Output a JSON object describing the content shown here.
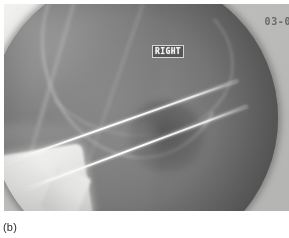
{
  "figure": {
    "caption": "(b)",
    "modality": "fluoroscopic radiograph"
  },
  "radiograph": {
    "overlays": {
      "laterality": "RIGHT",
      "timestamp": "03-0"
    },
    "field": {
      "shape": "circle",
      "description": "image-intensifier circular field"
    },
    "features": [
      {
        "name": "fixation-pin-upper",
        "kind": "metal pin",
        "orientation": "oblique, lower-left to upper-right"
      },
      {
        "name": "fixation-pin-lower",
        "kind": "metal pin",
        "orientation": "oblique, lower-left to upper-right, parallel to upper pin"
      },
      {
        "name": "radio-opaque-block",
        "kind": "bright opaque object",
        "location": "lower left"
      },
      {
        "name": "bone-mass-proximal",
        "kind": "bone",
        "location": "upper left"
      },
      {
        "name": "lucency-region",
        "kind": "lucency",
        "location": "center right"
      }
    ],
    "colors": {
      "field_dark": "#6d6d6d",
      "field_mid": "#8b8b8b",
      "surround_light": "#e4e4e2",
      "pin_bright": "#ffffff",
      "opaque_block": "#f4f4f2",
      "caption_text": "#2b2b2b",
      "timestamp_text": "#6a6a68"
    }
  }
}
